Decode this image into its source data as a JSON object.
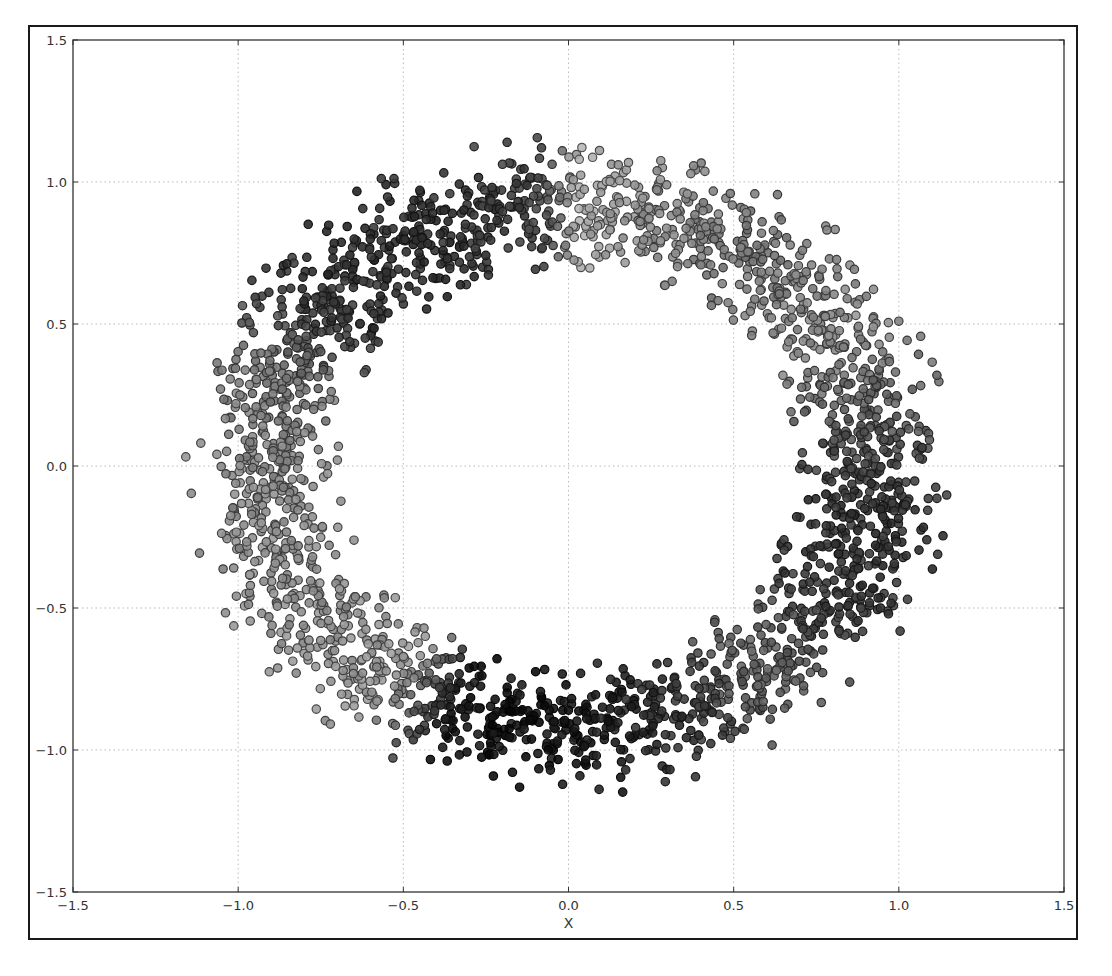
{
  "chart_data": {
    "type": "scatter",
    "title": "",
    "xlabel": "X",
    "ylabel": "",
    "xlim": [
      -1.5,
      1.5
    ],
    "ylim": [
      -1.5,
      1.5
    ],
    "grid": true,
    "legend": null,
    "x_ticks": [
      "-1.5",
      "-1.0",
      "-0.5",
      "0.0",
      "0.5",
      "1.0",
      "1.5"
    ],
    "y_ticks": [
      "1.5",
      "1.0",
      "0.5",
      "0.0",
      "-0.5",
      "-1.0",
      "-1.5"
    ],
    "ring": {
      "center": [
        0.0,
        0.0
      ],
      "inner_radius": 0.75,
      "outer_radius": 1.1,
      "n_points": 2600
    },
    "shade_stops_by_angle_deg": [
      {
        "angle": -180,
        "gray": "#8a8a8a"
      },
      {
        "angle": -140,
        "gray": "#909090"
      },
      {
        "angle": -125,
        "gray": "#9a9a9a"
      },
      {
        "angle": -112,
        "gray": "#111111"
      },
      {
        "angle": -90,
        "gray": "#151515"
      },
      {
        "angle": -70,
        "gray": "#333333"
      },
      {
        "angle": -50,
        "gray": "#666666"
      },
      {
        "angle": -30,
        "gray": "#3a3a3a"
      },
      {
        "angle": -10,
        "gray": "#303030"
      },
      {
        "angle": 10,
        "gray": "#5a5a5a"
      },
      {
        "angle": 30,
        "gray": "#8c8c8c"
      },
      {
        "angle": 55,
        "gray": "#777777"
      },
      {
        "angle": 75,
        "gray": "#8f8f8f"
      },
      {
        "angle": 88,
        "gray": "#aaaaaa"
      },
      {
        "angle": 95,
        "gray": "#444444"
      },
      {
        "angle": 120,
        "gray": "#2e2e2e"
      },
      {
        "angle": 145,
        "gray": "#3a3a3a"
      },
      {
        "angle": 160,
        "gray": "#7a7a7a"
      },
      {
        "angle": 180,
        "gray": "#8a8a8a"
      }
    ],
    "marker": {
      "shape": "circle",
      "radius_px": 4.2,
      "edge_color": "#2a2a2a",
      "edge_width": 1.2
    }
  },
  "plot_area": {
    "left": 73,
    "top": 40,
    "right": 1064,
    "bottom": 892
  }
}
